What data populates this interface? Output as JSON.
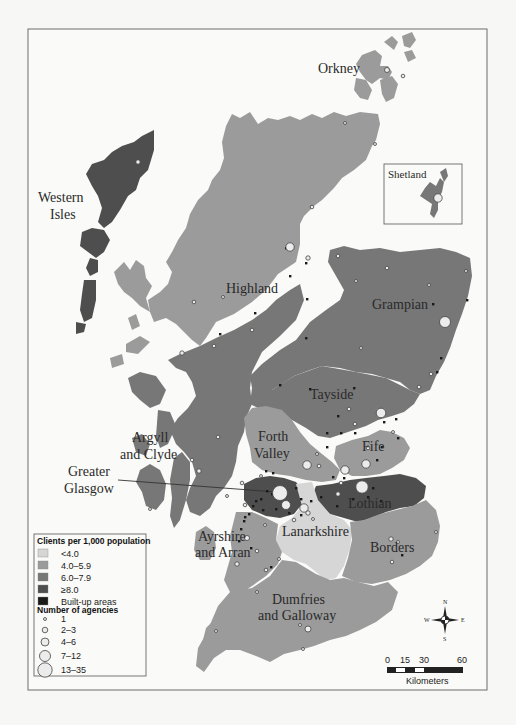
{
  "map": {
    "title": "",
    "regions": [
      {
        "name": "Orkney",
        "class": "4.0–5.9"
      },
      {
        "name": "Shetland",
        "class": "6.0–7.9"
      },
      {
        "name": "Western Isles",
        "class": "≥8.0"
      },
      {
        "name": "Highland",
        "class": "4.0–5.9"
      },
      {
        "name": "Grampian",
        "class": "6.0–7.9"
      },
      {
        "name": "Tayside",
        "class": "6.0–7.9"
      },
      {
        "name": "Argyll and Clyde",
        "class": "6.0–7.9"
      },
      {
        "name": "Forth Valley",
        "class": "4.0–5.9"
      },
      {
        "name": "Fife",
        "class": "4.0–5.9"
      },
      {
        "name": "Greater Glasgow",
        "class": "≥8.0"
      },
      {
        "name": "Lothian",
        "class": "≥8.0"
      },
      {
        "name": "Lanarkshire",
        "class": "<4.0"
      },
      {
        "name": "Ayrshire and Arran",
        "class": "4.0–5.9"
      },
      {
        "name": "Borders",
        "class": "4.0–5.9"
      },
      {
        "name": "Dumfries and Galloway",
        "class": "4.0–5.9"
      }
    ],
    "labels": {
      "orkney": "Orkney",
      "shetland": "Shetland",
      "western_isles_1": "Western",
      "western_isles_2": "Isles",
      "highland": "Highland",
      "grampian": "Grampian",
      "tayside": "Tayside",
      "argyll_1": "Argyll",
      "argyll_2": "and Clyde",
      "forth_1": "Forth",
      "forth_2": "Valley",
      "fife": "Fife",
      "glasgow_1": "Greater",
      "glasgow_2": "Glasgow",
      "lothian": "Lothian",
      "lanarkshire": "Lanarkshire",
      "ayrshire_1": "Ayrshire",
      "ayrshire_2": "and Arran",
      "borders": "Borders",
      "dumfries_1": "Dumfries",
      "dumfries_2": "and Galloway"
    },
    "colors": {
      "lt4": "#d6d6d6",
      "c4_6": "#9b9b9b",
      "c6_8": "#777777",
      "ge8": "#4e4e4e",
      "built": "#1a1a1a",
      "agency_fill": "#ececec"
    }
  },
  "legend": {
    "clients_title": "Clients per 1,000 population",
    "classes": [
      {
        "label": "<4.0",
        "color": "#d6d6d6"
      },
      {
        "label": "4.0–5.9",
        "color": "#9b9b9b"
      },
      {
        "label": "6.0–7.9",
        "color": "#777777"
      },
      {
        "label": "≥8.0",
        "color": "#4e4e4e"
      },
      {
        "label": "Built-up areas",
        "color": "#1a1a1a"
      }
    ],
    "agencies_title": "Number of agencies",
    "agencies": [
      {
        "label": "1"
      },
      {
        "label": "2–3"
      },
      {
        "label": "4–6"
      },
      {
        "label": "7–12"
      },
      {
        "label": "13–35"
      }
    ]
  },
  "compass": {
    "n": "N",
    "s": "S",
    "e": "E",
    "w": "W"
  },
  "scale_bar": {
    "ticks": [
      "0",
      "15",
      "30",
      "60"
    ],
    "unit": "Kilometers"
  }
}
